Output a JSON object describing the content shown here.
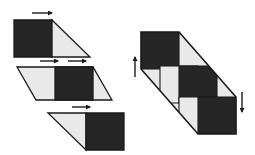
{
  "figure": {
    "canvas": {
      "width": 255,
      "height": 155
    },
    "colors": {
      "dark": "#262626",
      "light": "#e9e9e9",
      "outline": "#1a1a1a",
      "background": "#ffffff",
      "arrow": "#1a1a1a"
    },
    "panels": [
      {
        "id": "panel-1",
        "label": "square with right triangle",
        "pieces": [
          {
            "name": "dark-square",
            "fill": "dark",
            "points": "14,20 52,20 52,57 14,57"
          },
          {
            "name": "light-triangle",
            "fill": "light",
            "points": "52,20 90,57 52,57"
          }
        ],
        "arrows": [
          {
            "name": "arrow-right-top",
            "direction": "right",
            "x1": 32,
            "y1": 13,
            "x2": 52,
            "y2": 13
          }
        ]
      },
      {
        "id": "panel-2",
        "label": "parallelogram with centered dark square",
        "pieces": [
          {
            "name": "light-left-triangle",
            "fill": "light",
            "points": "17,67 55,67 55,100 17,100"
          },
          {
            "name": "dark-square",
            "fill": "dark",
            "points": "55,67 93,67 93,100 55,100"
          },
          {
            "name": "light-right-triangle",
            "fill": "light",
            "points": "93,67 112,67 112,100 93,100"
          }
        ],
        "parallelogram": "17,67 93,67 112,100 36,100",
        "dark_band": "55,67 93,67 93,100 55,100",
        "arrows": [
          {
            "name": "arrow-right-left",
            "direction": "right",
            "x1": 40,
            "y1": 61,
            "x2": 58,
            "y2": 61
          },
          {
            "name": "arrow-right-right",
            "direction": "right",
            "x1": 68,
            "y1": 61,
            "x2": 86,
            "y2": 61
          }
        ]
      },
      {
        "id": "panel-3",
        "label": "right triangle with dark square",
        "pieces": [
          {
            "name": "light-triangle",
            "fill": "light",
            "points": "48,113 86,113 86,150"
          },
          {
            "name": "dark-square",
            "fill": "dark",
            "points": "86,113 124,113 124,150 86,150"
          }
        ],
        "arrows": [
          {
            "name": "arrow-right-bottom",
            "direction": "right",
            "x1": 72,
            "y1": 107,
            "x2": 90,
            "y2": 107
          }
        ]
      },
      {
        "id": "panel-4",
        "label": "diagonal checkerboard parallelogram",
        "outline": "141,32 179,32 236,97 236,134 198,134 141,69",
        "cells": [
          {
            "name": "cell-dark-top",
            "fill": "dark",
            "points": "141,32 179,32 179,69 141,69"
          },
          {
            "name": "cell-light-upper",
            "fill": "light",
            "points": "179,32 217,32 217,69 179,69"
          },
          {
            "name": "cell-light-left",
            "fill": "light",
            "points": "160,66 198,66 198,103 160,103"
          },
          {
            "name": "cell-dark-middle",
            "fill": "dark",
            "points": "179,66 217,66 217,103 179,103"
          },
          {
            "name": "cell-light-lower",
            "fill": "light",
            "points": "179,97 217,97 217,134 179,134"
          },
          {
            "name": "cell-dark-bottom",
            "fill": "dark",
            "points": "198,97 236,97 236,134 198,134"
          }
        ],
        "arrows": [
          {
            "name": "arrow-up-left",
            "direction": "up",
            "x": 135,
            "y1": 77,
            "y2": 57
          },
          {
            "name": "arrow-down-right",
            "direction": "down",
            "x": 242,
            "y1": 92,
            "y2": 112
          }
        ]
      }
    ]
  }
}
